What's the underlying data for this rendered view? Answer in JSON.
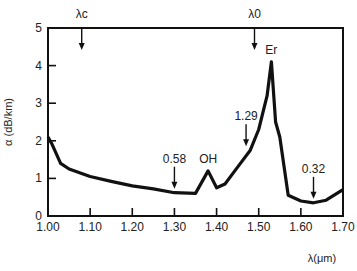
{
  "chart_data": {
    "type": "line",
    "title": "",
    "xlabel": "λ(μm)",
    "ylabel": "α (dB/km)",
    "xlim": [
      1.0,
      1.7
    ],
    "ylim": [
      0,
      5
    ],
    "grid": false,
    "x_ticks": [
      "1.00",
      "1.10",
      "1.20",
      "1.30",
      "1.40",
      "1.50",
      "1.60",
      "1.70"
    ],
    "y_ticks": [
      "0",
      "1",
      "2",
      "3",
      "4",
      "5"
    ],
    "series": [
      {
        "name": "attenuation",
        "x": [
          1.0,
          1.01,
          1.03,
          1.05,
          1.1,
          1.15,
          1.2,
          1.25,
          1.3,
          1.35,
          1.38,
          1.4,
          1.42,
          1.45,
          1.48,
          1.5,
          1.52,
          1.53,
          1.54,
          1.55,
          1.57,
          1.6,
          1.63,
          1.66,
          1.7
        ],
        "values": [
          2.1,
          1.9,
          1.4,
          1.25,
          1.05,
          0.92,
          0.8,
          0.72,
          0.62,
          0.6,
          1.2,
          0.75,
          0.85,
          1.3,
          1.75,
          2.3,
          3.2,
          4.1,
          2.5,
          2.1,
          0.55,
          0.4,
          0.35,
          0.42,
          0.7
        ]
      }
    ],
    "annotations": [
      {
        "label": "λc",
        "x": 1.08,
        "position": "top"
      },
      {
        "label": "λ0",
        "x": 1.49,
        "position": "top"
      },
      {
        "label": "Er",
        "x": 1.53,
        "y": 4.3
      },
      {
        "label": "OH",
        "x": 1.38,
        "y": 1.4
      },
      {
        "label": "0.58",
        "x": 1.3,
        "arrow": true
      },
      {
        "label": "1.29",
        "x": 1.47,
        "arrow": true
      },
      {
        "label": "0.32",
        "x": 1.63,
        "arrow": true
      }
    ]
  }
}
